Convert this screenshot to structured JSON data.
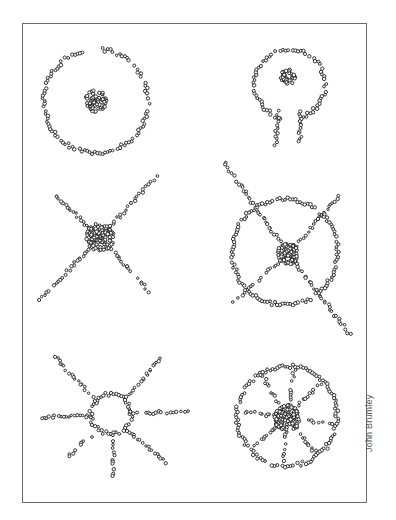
{
  "figure": {
    "frame": {
      "x": 22,
      "y": 23,
      "w": 345,
      "h": 480,
      "border_color": "#6a6a6a"
    },
    "credit": "John Brumley",
    "bead_color": "#1e1e1e",
    "panels": [
      {
        "id": "circle-with-center",
        "cluster": {
          "cx": 96,
          "cy": 101,
          "r": 11
        },
        "rings": [
          {
            "cx": 96,
            "cy": 101,
            "r": 52,
            "gaps": [
              [
                255,
                275
              ]
            ]
          }
        ],
        "spokes": []
      },
      {
        "id": "keyhole",
        "cluster": {
          "cx": 288,
          "cy": 77,
          "r": 8
        },
        "rings": [
          {
            "cx": 290,
            "cy": 84,
            "r": 35,
            "gaps": [
              [
                78,
                102
              ]
            ]
          }
        ],
        "spokes": [
          {
            "x1": 278,
            "y1": 112,
            "x2": 276,
            "y2": 145
          },
          {
            "x1": 300,
            "y1": 112,
            "x2": 300,
            "y2": 142
          }
        ]
      },
      {
        "id": "x-cross",
        "cluster": {
          "cx": 100,
          "cy": 237,
          "r": 14
        },
        "rings": [],
        "spokes": [
          {
            "x1": 100,
            "y1": 237,
            "x2": 55,
            "y2": 195
          },
          {
            "x1": 100,
            "y1": 237,
            "x2": 157,
            "y2": 175
          },
          {
            "x1": 100,
            "y1": 237,
            "x2": 40,
            "y2": 300
          },
          {
            "x1": 100,
            "y1": 237,
            "x2": 150,
            "y2": 292
          }
        ]
      },
      {
        "id": "circle-with-cross",
        "cluster": {
          "cx": 288,
          "cy": 254,
          "r": 11
        },
        "rings": [
          {
            "cx": 285,
            "cy": 252,
            "r": 53,
            "gaps": []
          }
        ],
        "spokes": [
          {
            "x1": 225,
            "y1": 163,
            "x2": 288,
            "y2": 254
          },
          {
            "x1": 340,
            "y1": 195,
            "x2": 288,
            "y2": 254
          },
          {
            "x1": 233,
            "y1": 302,
            "x2": 288,
            "y2": 254
          },
          {
            "x1": 288,
            "y1": 254,
            "x2": 350,
            "y2": 335
          }
        ]
      },
      {
        "id": "sun",
        "cluster": null,
        "rings": [
          {
            "cx": 111,
            "cy": 414,
            "r": 20,
            "gaps": []
          }
        ],
        "spokes": [
          {
            "x1": 95,
            "y1": 400,
            "x2": 55,
            "y2": 357
          },
          {
            "x1": 127,
            "y1": 398,
            "x2": 160,
            "y2": 358
          },
          {
            "x1": 91,
            "y1": 416,
            "x2": 38,
            "y2": 417
          },
          {
            "x1": 131,
            "y1": 413,
            "x2": 187,
            "y2": 412
          },
          {
            "x1": 97,
            "y1": 430,
            "x2": 68,
            "y2": 457
          },
          {
            "x1": 113,
            "y1": 434,
            "x2": 114,
            "y2": 475
          },
          {
            "x1": 127,
            "y1": 430,
            "x2": 165,
            "y2": 462
          }
        ]
      },
      {
        "id": "wheel",
        "cluster": {
          "cx": 287,
          "cy": 418,
          "r": 13
        },
        "rings": [
          {
            "cx": 287,
            "cy": 416,
            "r": 50,
            "gaps": []
          }
        ],
        "spokes": [
          {
            "x1": 287,
            "y1": 418,
            "x2": 262,
            "y2": 375
          },
          {
            "x1": 287,
            "y1": 418,
            "x2": 295,
            "y2": 367
          },
          {
            "x1": 287,
            "y1": 418,
            "x2": 322,
            "y2": 382
          },
          {
            "x1": 287,
            "y1": 418,
            "x2": 245,
            "y2": 412
          },
          {
            "x1": 287,
            "y1": 418,
            "x2": 333,
            "y2": 425
          },
          {
            "x1": 287,
            "y1": 418,
            "x2": 254,
            "y2": 445
          },
          {
            "x1": 287,
            "y1": 418,
            "x2": 284,
            "y2": 462
          },
          {
            "x1": 287,
            "y1": 418,
            "x2": 315,
            "y2": 452
          }
        ]
      }
    ]
  }
}
